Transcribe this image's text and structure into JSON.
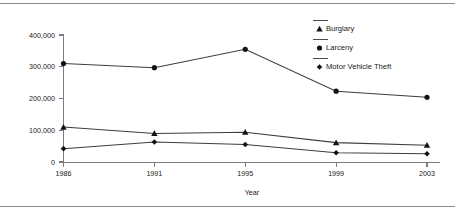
{
  "chart_data": {
    "type": "line",
    "title": "",
    "subtitle": "",
    "xlabel": "Year",
    "ylabel": "",
    "categories": [
      "1986",
      "1991",
      "1995",
      "1999",
      "2003"
    ],
    "x": [
      1986,
      1991,
      1995,
      1999,
      2003
    ],
    "xlim": [
      1986,
      2003
    ],
    "ylim": [
      0,
      400000
    ],
    "yticks": [
      0,
      100000,
      200000,
      300000,
      400000
    ],
    "ytick_labels": [
      "0",
      "100,000",
      "200,000",
      "300,000",
      "400,000"
    ],
    "xtick_labels": [
      "1986",
      "1991",
      "1995",
      "1999",
      "2003"
    ],
    "grid": false,
    "legend_position": "top-right",
    "series": [
      {
        "name": "Burglary",
        "marker": "triangle",
        "values": [
          110000,
          90000,
          94000,
          61000,
          53000
        ]
      },
      {
        "name": "Larceny",
        "marker": "circle",
        "values": [
          310000,
          297000,
          355000,
          223000,
          204000
        ]
      },
      {
        "name": "Motor Vehicle Theft",
        "marker": "diamond",
        "values": [
          42000,
          63000,
          55000,
          29000,
          26000
        ]
      }
    ],
    "colors": {
      "line": "#3d3d3d",
      "marker": "#121212",
      "axis": "#7d7d7d",
      "text": "#1a1a1a",
      "background": "#ffffff",
      "rule": "#8c8c8c"
    }
  },
  "figure": {
    "top_rule": "",
    "bottom_rule": ""
  }
}
